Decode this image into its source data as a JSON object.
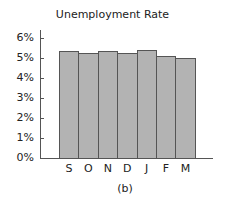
{
  "chart_data": {
    "type": "bar",
    "title": "Unemployment Rate",
    "categories": [
      "S",
      "O",
      "N",
      "D",
      "J",
      "F",
      "M"
    ],
    "values": [
      5.4,
      5.3,
      5.4,
      5.3,
      5.45,
      5.15,
      5.05
    ],
    "xlabel": "",
    "ylabel": "",
    "ylim": [
      0,
      6
    ],
    "yticks": [
      "0%",
      "1%",
      "2%",
      "3%",
      "4%",
      "5%",
      "6%"
    ],
    "grid": false,
    "legend": null,
    "caption": "(b)",
    "bar_color": "#b3b3b3",
    "bar_edge_color": "#555555"
  }
}
